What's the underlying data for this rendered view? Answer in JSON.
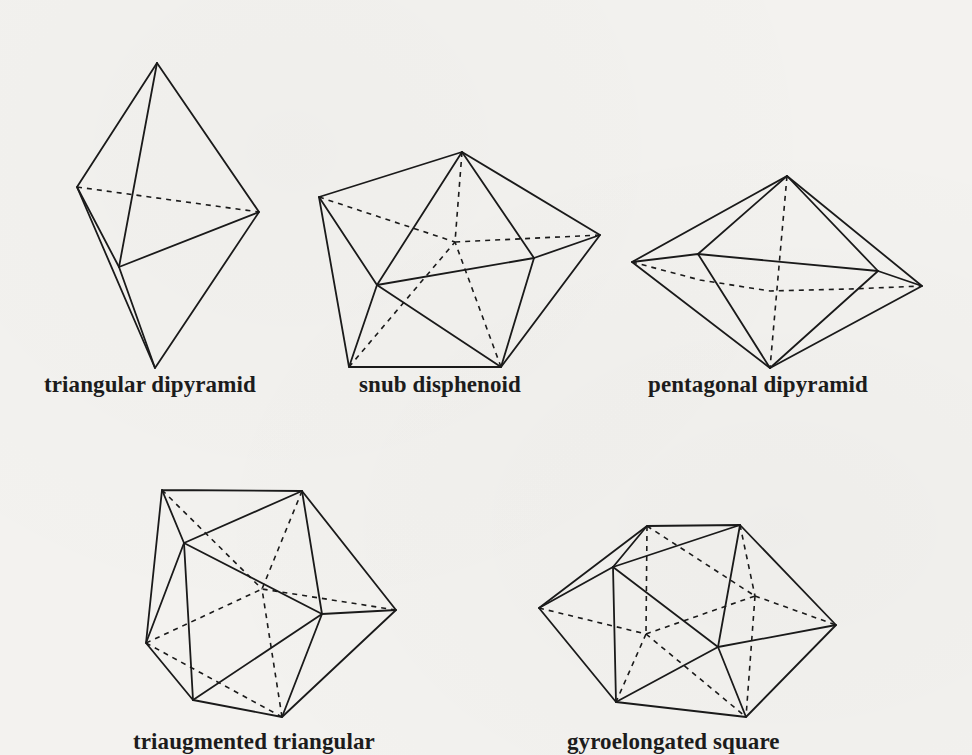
{
  "figures": [
    {
      "id": "triangular-dipyramid",
      "caption": "triangular dipyramid"
    },
    {
      "id": "snub-disphenoid",
      "caption": "snub disphenoid"
    },
    {
      "id": "pentagonal-dipyramid",
      "caption": "pentagonal dipyramid"
    },
    {
      "id": "triaugmented-triangular-prism",
      "caption": "triaugmented triangular"
    },
    {
      "id": "gyroelongated-square-dipyramid",
      "caption": "gyroelongated square"
    }
  ],
  "style": {
    "line_color": "#1a1a1a",
    "background": "#f3f2ef"
  }
}
